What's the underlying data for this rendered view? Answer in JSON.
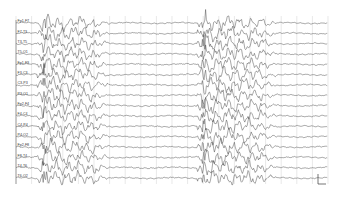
{
  "figure": {
    "type": "eeg-trace",
    "plot_area": {
      "x0": 16,
      "y0": 16,
      "x1": 328,
      "y1": 184
    },
    "grid_spacing_px": 15.6,
    "colors": {
      "trace": "#3a3a3a",
      "grid": "#d8d8d8",
      "frame": "#8a8a8a",
      "background": "#ffffff"
    },
    "channels": [
      "Fp1-F7",
      "F7-T3",
      "T3-T5",
      "T5-O1",
      "Fp1-F3",
      "F3-C3",
      "C3-P3",
      "P3-O1",
      "Fp2-F4",
      "F4-C4",
      "C4-P4",
      "P4-O2",
      "Fp2-F8",
      "F8-T4",
      "T4-T6",
      "T6-O2"
    ],
    "bursts": [
      {
        "start_px": 40,
        "end_px": 105
      },
      {
        "start_px": 200,
        "end_px": 272
      }
    ],
    "scale_bar": {
      "x": 318,
      "y_top": 174,
      "y_bottom": 184,
      "width": 8
    }
  }
}
